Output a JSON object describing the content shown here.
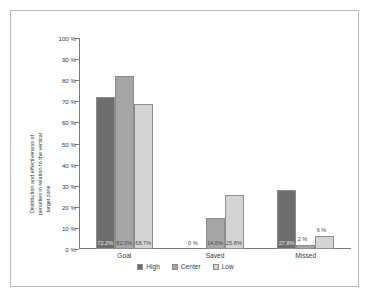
{
  "chart_data": {
    "type": "bar",
    "title": "",
    "subtitle": "",
    "xlabel": "",
    "ylabel": "Distribution and effectiveness of penalties in relation to the vertical target zone",
    "ylabel_line1": "Distribution and effectiveness of",
    "ylabel_line2": "penalties in relation to the vertical",
    "ylabel_line3": "target zone",
    "categories": [
      "Goal",
      "Saved",
      "Missed"
    ],
    "series": [
      {
        "name": "High",
        "color": "#6e6e6e",
        "values": [
          72.2,
          0,
          27.8
        ],
        "labels": [
          "72.2%",
          "0 %",
          "27.8%"
        ]
      },
      {
        "name": "Center",
        "color": "#a6a6a6",
        "values": [
          82.0,
          14.6,
          2
        ],
        "labels": [
          "82.0%",
          "14.6%",
          "2 %"
        ]
      },
      {
        "name": "Low",
        "color": "#d4d4d4",
        "values": [
          68.7,
          25.8,
          6
        ],
        "labels": [
          "68.7%",
          "25.8%",
          "6 %"
        ]
      }
    ],
    "ylim": [
      0,
      100
    ],
    "y_ticks": [
      0,
      10,
      20,
      30,
      40,
      50,
      60,
      70,
      80,
      90,
      100
    ],
    "y_tick_labels": [
      "0 %",
      "10 %",
      "20 %",
      "30 %",
      "40 %",
      "50 %",
      "60 %",
      "70 %",
      "80 %",
      "90 %",
      "100 %"
    ],
    "grid": false,
    "legend_position": "bottom",
    "legend_entries": [
      "High",
      "Center",
      "Low"
    ]
  },
  "colors": {
    "frame_border": "#b9b9b9",
    "axis": "#7a7a7a",
    "bar_border": "#8d8d8d",
    "text": "#3b3b3b",
    "background": "#ffffff"
  }
}
